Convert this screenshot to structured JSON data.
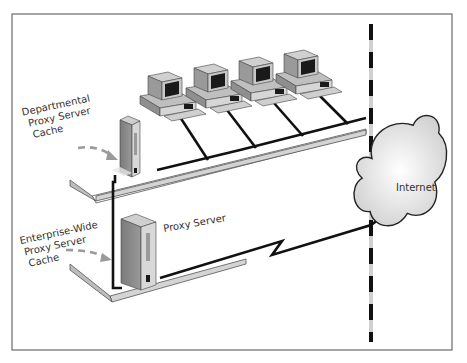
{
  "diagram": {
    "labels": {
      "departmental": [
        "Departmental",
        "Proxy Server",
        "Cache"
      ],
      "enterprise": [
        "Enterprise-Wide",
        "Proxy Server",
        "Cache"
      ],
      "proxy_server": "Proxy  Server",
      "internet": "Internet"
    },
    "nodes": [
      {
        "id": "workstation-1",
        "type": "workstation"
      },
      {
        "id": "workstation-2",
        "type": "workstation"
      },
      {
        "id": "workstation-3",
        "type": "workstation"
      },
      {
        "id": "workstation-4",
        "type": "workstation"
      },
      {
        "id": "departmental-proxy",
        "type": "server",
        "label": "Departmental Proxy Server Cache"
      },
      {
        "id": "enterprise-proxy",
        "type": "server",
        "label": "Proxy Server"
      },
      {
        "id": "internet",
        "type": "cloud",
        "label": "Internet"
      }
    ],
    "edges": [
      {
        "from": "workstation-1",
        "to": "departmental-proxy"
      },
      {
        "from": "workstation-2",
        "to": "departmental-proxy"
      },
      {
        "from": "workstation-3",
        "to": "departmental-proxy"
      },
      {
        "from": "workstation-4",
        "to": "departmental-proxy"
      },
      {
        "from": "departmental-proxy",
        "to": "enterprise-proxy"
      },
      {
        "from": "enterprise-proxy",
        "to": "internet",
        "style": "lightning"
      }
    ],
    "colors": {
      "frame": "#666666",
      "line": "#111111",
      "arrow": "#999999",
      "platform_top": "#ffffff",
      "platform_edge": "#cfcfcf",
      "device_front": "#d9d9d9",
      "device_side": "#8c8c8c",
      "screen": "#1a1a1a",
      "cloud_fill": "#eeeeee"
    }
  }
}
